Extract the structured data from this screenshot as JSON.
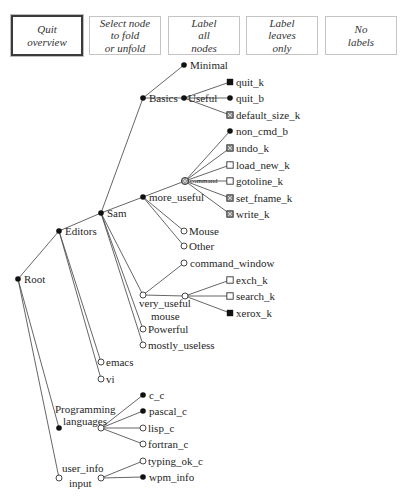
{
  "toolbar": {
    "buttons": [
      {
        "id": "quit-overview",
        "lines": [
          "Quit",
          "overview"
        ],
        "active": true,
        "x": 11
      },
      {
        "id": "select-node-fold",
        "lines": [
          "Select node",
          "to fold",
          "or unfold"
        ],
        "active": false,
        "x": 89
      },
      {
        "id": "label-all-nodes",
        "lines": [
          "Label",
          "all",
          "nodes"
        ],
        "active": false,
        "x": 168
      },
      {
        "id": "label-leaves-only",
        "lines": [
          "Label",
          "leaves",
          "only"
        ],
        "active": false,
        "x": 246
      },
      {
        "id": "no-labels",
        "lines": [
          "No",
          "labels"
        ],
        "active": false,
        "x": 325
      }
    ]
  },
  "tree": {
    "node_types": {
      "dot": "filled-circle",
      "open": "open-circle",
      "fsq": "filled-square",
      "osq": "open-square",
      "hsq": "hatched-square",
      "hcirc": "hatched-circle"
    },
    "nodes": [
      {
        "id": "root",
        "x": 18,
        "y": 279,
        "type": "dot",
        "label": [
          "Root"
        ]
      },
      {
        "id": "editors",
        "x": 59,
        "y": 231,
        "type": "dot",
        "label": [
          "Editors"
        ]
      },
      {
        "id": "sam",
        "x": 101,
        "y": 213,
        "type": "dot",
        "label": [
          "Sam"
        ]
      },
      {
        "id": "basics",
        "x": 143,
        "y": 98,
        "type": "dot",
        "label": [
          "Basics"
        ]
      },
      {
        "id": "minimal",
        "x": 184,
        "y": 65,
        "type": "dot",
        "label": [
          "Minimal"
        ]
      },
      {
        "id": "useful",
        "x": 184,
        "y": 98,
        "type": "dot",
        "label": [
          "Useful"
        ],
        "dx": 4
      },
      {
        "id": "quit_k",
        "x": 230,
        "y": 82,
        "type": "fsq",
        "label": [
          "quit_k"
        ]
      },
      {
        "id": "quit_b",
        "x": 230,
        "y": 98,
        "type": "dot",
        "label": [
          "quit_b"
        ]
      },
      {
        "id": "default_size_k",
        "x": 230,
        "y": 115,
        "type": "hsq",
        "label": [
          "default_size_k"
        ]
      },
      {
        "id": "more_useful",
        "x": 143,
        "y": 197,
        "type": "dot",
        "label": [
          "more_useful"
        ]
      },
      {
        "id": "command",
        "x": 185,
        "y": 181,
        "type": "hcirc",
        "label": [
          "command"
        ],
        "small": true,
        "dx": 5,
        "dy": 2
      },
      {
        "id": "non_cmd_b",
        "x": 230,
        "y": 131,
        "type": "dot",
        "label": [
          "non_cmd_b"
        ]
      },
      {
        "id": "undo_k",
        "x": 230,
        "y": 148,
        "type": "hsq",
        "label": [
          "undo_k"
        ]
      },
      {
        "id": "load_new_k",
        "x": 230,
        "y": 165,
        "type": "osq",
        "label": [
          "load_new_k"
        ]
      },
      {
        "id": "gotoline_k",
        "x": 230,
        "y": 181,
        "type": "osq",
        "label": [
          "gotoline_k"
        ]
      },
      {
        "id": "set_fname_k",
        "x": 230,
        "y": 198,
        "type": "hsq",
        "label": [
          "set_fname_k"
        ]
      },
      {
        "id": "write_k",
        "x": 230,
        "y": 214,
        "type": "hsq",
        "label": [
          "write_k"
        ]
      },
      {
        "id": "mouse",
        "x": 184,
        "y": 231,
        "type": "open",
        "label": [
          "Mouse"
        ],
        "dx": 5
      },
      {
        "id": "other",
        "x": 184,
        "y": 246,
        "type": "open",
        "label": [
          "Other"
        ],
        "dx": 5
      },
      {
        "id": "very_useful",
        "x": 143,
        "y": 295,
        "type": "open",
        "label": [
          "very_useful",
          "mouse"
        ],
        "label_pos": [
          [
            139,
            307
          ],
          [
            151,
            320
          ]
        ]
      },
      {
        "id": "command_window",
        "x": 184,
        "y": 263,
        "type": "open",
        "label": [
          "command_window"
        ]
      },
      {
        "id": "very_useful_hub",
        "x": 185,
        "y": 296,
        "type": "open",
        "label": []
      },
      {
        "id": "exch_k",
        "x": 230,
        "y": 280,
        "type": "osq",
        "label": [
          "exch_k"
        ]
      },
      {
        "id": "search_k",
        "x": 230,
        "y": 296,
        "type": "osq",
        "label": [
          "search_k"
        ]
      },
      {
        "id": "xerox_k",
        "x": 230,
        "y": 313,
        "type": "fsq",
        "label": [
          "xerox_k"
        ]
      },
      {
        "id": "powerful",
        "x": 143,
        "y": 329,
        "type": "open",
        "label": [
          "Powerful"
        ],
        "dx": 5
      },
      {
        "id": "mostly_useless",
        "x": 143,
        "y": 345,
        "type": "open",
        "label": [
          "mostly_useless"
        ],
        "dx": 5
      },
      {
        "id": "emacs",
        "x": 101,
        "y": 362,
        "type": "open",
        "label": [
          "emacs"
        ],
        "dx": 5
      },
      {
        "id": "vi",
        "x": 101,
        "y": 379,
        "type": "open",
        "label": [
          "vi"
        ],
        "dx": 5
      },
      {
        "id": "programming_languages",
        "x": 59,
        "y": 428,
        "type": "dot",
        "label": [
          "Programming",
          "languages"
        ],
        "label_pos": [
          [
            55,
            413
          ],
          [
            63,
            425
          ]
        ]
      },
      {
        "id": "languages_hub",
        "x": 101,
        "y": 428,
        "type": "open",
        "label": []
      },
      {
        "id": "c_c",
        "x": 143,
        "y": 395,
        "type": "dot",
        "label": [
          "c_c"
        ]
      },
      {
        "id": "pascal_c",
        "x": 143,
        "y": 411,
        "type": "dot",
        "label": [
          "pascal_c"
        ]
      },
      {
        "id": "lisp_c",
        "x": 143,
        "y": 428,
        "type": "open",
        "label": [
          "lisp_c"
        ],
        "dx": 5
      },
      {
        "id": "fortran_c",
        "x": 143,
        "y": 444,
        "type": "open",
        "label": [
          "fortran_c"
        ],
        "dx": 5
      },
      {
        "id": "user_info_input",
        "x": 59,
        "y": 478,
        "type": "open",
        "label": [
          "user_info",
          "input"
        ],
        "label_pos": [
          [
            62,
            472
          ],
          [
            69,
            487
          ]
        ]
      },
      {
        "id": "user_info_hub",
        "x": 101,
        "y": 478,
        "type": "open",
        "label": []
      },
      {
        "id": "typing_ok_c",
        "x": 143,
        "y": 461,
        "type": "open",
        "label": [
          "typing_ok_c"
        ],
        "dx": 5
      },
      {
        "id": "wpm_info",
        "x": 143,
        "y": 477,
        "type": "dot",
        "label": [
          "wpm_info"
        ]
      }
    ],
    "edges": [
      [
        "root",
        "editors"
      ],
      [
        "root",
        "programming_languages"
      ],
      [
        "root",
        "user_info_input"
      ],
      [
        "editors",
        "sam"
      ],
      [
        "editors",
        "emacs"
      ],
      [
        "editors",
        "vi"
      ],
      [
        "sam",
        "basics"
      ],
      [
        "sam",
        "more_useful"
      ],
      [
        "sam",
        "very_useful"
      ],
      [
        "sam",
        "powerful"
      ],
      [
        "sam",
        "mostly_useless"
      ],
      [
        "basics",
        "minimal"
      ],
      [
        "basics",
        "useful"
      ],
      [
        "useful",
        "quit_k"
      ],
      [
        "useful",
        "quit_b"
      ],
      [
        "useful",
        "default_size_k"
      ],
      [
        "more_useful",
        "command"
      ],
      [
        "more_useful",
        "mouse"
      ],
      [
        "more_useful",
        "other"
      ],
      [
        "command",
        "non_cmd_b"
      ],
      [
        "command",
        "undo_k"
      ],
      [
        "command",
        "load_new_k"
      ],
      [
        "command",
        "gotoline_k"
      ],
      [
        "command",
        "set_fname_k"
      ],
      [
        "command",
        "write_k"
      ],
      [
        "very_useful",
        "command_window"
      ],
      [
        "very_useful",
        "very_useful_hub"
      ],
      [
        "very_useful_hub",
        "exch_k"
      ],
      [
        "very_useful_hub",
        "search_k"
      ],
      [
        "very_useful_hub",
        "xerox_k"
      ],
      [
        "languages_hub",
        "c_c"
      ],
      [
        "languages_hub",
        "pascal_c"
      ],
      [
        "languages_hub",
        "lisp_c"
      ],
      [
        "languages_hub",
        "fortran_c"
      ],
      [
        "user_info_hub",
        "typing_ok_c"
      ],
      [
        "user_info_hub",
        "wpm_info"
      ]
    ]
  }
}
